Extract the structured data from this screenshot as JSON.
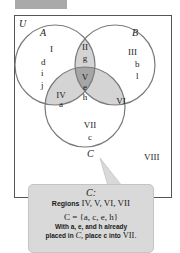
{
  "diagram": {
    "universe_label": "U",
    "circles": [
      {
        "name": "A",
        "cx": 55,
        "cy": 65,
        "r": 40
      },
      {
        "name": "B",
        "cx": 115,
        "cy": 65,
        "r": 40
      },
      {
        "name": "C",
        "cx": 85,
        "cy": 107,
        "r": 40
      }
    ],
    "regions": {
      "I": {
        "label": "I",
        "elements": [
          "d",
          "i",
          "j"
        ]
      },
      "II": {
        "label": "II",
        "elements": [
          "g"
        ]
      },
      "III": {
        "label": "III",
        "elements": [
          "b",
          "l"
        ]
      },
      "IV": {
        "label": "IV",
        "elements": [
          "a"
        ]
      },
      "V": {
        "label": "V",
        "elements": [
          "e",
          "h"
        ]
      },
      "VI": {
        "label": "VI",
        "elements": []
      },
      "VII": {
        "label": "VII",
        "elements": [
          "c"
        ]
      },
      "VIII": {
        "label": "VIII",
        "elements": []
      }
    },
    "colors": {
      "light_shade": "#d4d4d4",
      "dark_shade": "#a6a6a6",
      "stroke": "#7a7a7a",
      "box_border": "#555555"
    }
  },
  "callout": {
    "title": "C:",
    "regions_prefix": "Regions",
    "regions_list": "IV, V, VI, VII",
    "set_expr": "C = {a, c, e, h}",
    "note_line1": "With a, e, and h already",
    "note_line2_a": "placed in",
    "note_line2_c": "C,",
    "note_line2_b": "place c into",
    "note_line2_region": "VII."
  }
}
